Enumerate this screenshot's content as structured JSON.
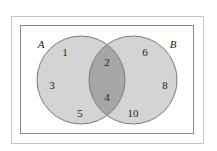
{
  "diagram": {
    "type": "venn",
    "universal_set": {
      "label": ""
    },
    "sets": [
      {
        "label": "A",
        "only_elements": [
          "1",
          "3",
          "5"
        ]
      },
      {
        "label": "B",
        "only_elements": [
          "6",
          "8",
          "10"
        ]
      }
    ],
    "intersection": [
      "2",
      "4"
    ],
    "colors": {
      "circle_fill": "#d3d3d3",
      "intersection_fill": "#a9a9a9",
      "stroke": "#777777",
      "frame": "#b5b5b5"
    },
    "labels": {
      "A": "A",
      "B": "B",
      "n1": "1",
      "n3": "3",
      "n5": "5",
      "n2": "2",
      "n4": "4",
      "n6": "6",
      "n8": "8",
      "n10": "10"
    }
  }
}
